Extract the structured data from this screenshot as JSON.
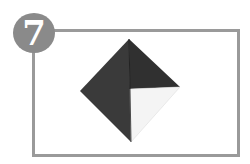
{
  "step": {
    "number": "7"
  },
  "colors": {
    "frame": "#9a9a9a",
    "badge": "#8a8a8a",
    "paper_dark_left": "#3a3a3a",
    "paper_dark_right": "#333333",
    "paper_white": "#f4f4f4"
  },
  "illustration": {
    "shape": "diamond",
    "description": "Origami diamond, dark colored side with bottom-right quadrant showing white side"
  }
}
